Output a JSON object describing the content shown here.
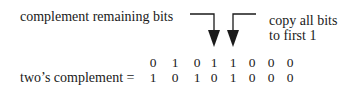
{
  "labels": {
    "left": "complement remaining bits",
    "right_line1": "copy all bits",
    "right_line2": "to first 1",
    "result": "two’s complement ="
  },
  "rows": {
    "original": [
      "0",
      "1",
      "0",
      "1",
      "1",
      "0",
      "0",
      "0"
    ],
    "complement": [
      "1",
      "0",
      "1",
      "0",
      "1",
      "0",
      "0",
      "0"
    ]
  },
  "colors": {
    "ink": "#1a1a1a",
    "background": "#ffffff"
  }
}
